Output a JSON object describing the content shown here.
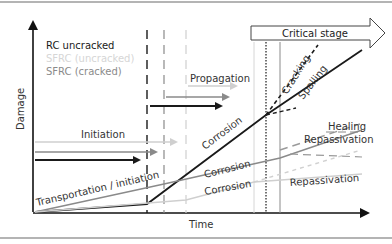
{
  "figure": {
    "y_axis_label": "Damage",
    "x_axis_label": "Time",
    "legend": [
      {
        "label": "RC uncracked",
        "color": "#1a1a1a"
      },
      {
        "label": "SFRC (uncracked)",
        "color": "#d6d6d6"
      },
      {
        "label": "SFRC (cracked)",
        "color": "#8a8a8a"
      }
    ],
    "stages": {
      "initiation": "Initiation",
      "propagation": "Propagation",
      "critical": "Critical stage"
    },
    "curve_labels": {
      "transport": "Transportation / initiation",
      "corrosion_rc": "Corrosion",
      "corrosion_cracked": "Corrosion",
      "corrosion_uncracked": "Corrosion",
      "cracking": "Cracking",
      "spalling": "Spalling",
      "healing": "Healing",
      "repassivation_1": "Repassivation",
      "repassivation_2": "Repassivation"
    },
    "colors": {
      "black": "#1a1a1a",
      "mid_gray": "#8a8a8a",
      "light_gray": "#cfcfcf",
      "frame": "#6a6a6a"
    }
  }
}
